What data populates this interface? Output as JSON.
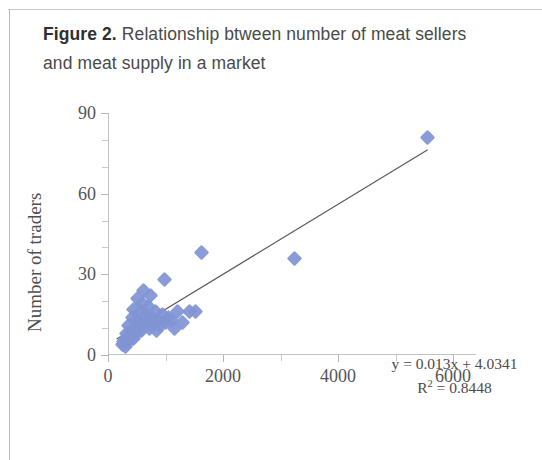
{
  "caption": {
    "figure_label": "Figure 2.",
    "text": " Relationship btween number of meat sellers and meat supply in a market"
  },
  "annotation": {
    "equation": "y = 0.013x + 4.0341",
    "r_squared_prefix": "R",
    "r_squared_exp": "2",
    "r_squared_value": " = 0.8448"
  },
  "colors": {
    "marker": "#8094d4",
    "trendline": "#595959",
    "axis": "#c2c2c2",
    "caption_text": "#4a4a4a"
  },
  "chart_data": {
    "type": "scatter",
    "title": "Figure 2. Relationship btween number of meat sellers and meat supply in a market",
    "xlabel": "Market supply of meat, kg/d",
    "ylabel": "Number of traders",
    "xlim": [
      0,
      6400
    ],
    "ylim": [
      0,
      90
    ],
    "xticks": [
      0,
      2000,
      4000,
      6000
    ],
    "yticks": [
      0,
      30,
      60,
      90
    ],
    "xtick_labels": [
      "0",
      "2000",
      "4000",
      "6000"
    ],
    "ytick_labels": [
      "0",
      "30",
      "60",
      "90"
    ],
    "minor_xticks": [
      1000,
      3000,
      5000
    ],
    "minor_yticks": [
      10,
      20,
      40,
      50,
      70,
      80
    ],
    "grid": false,
    "legend": null,
    "marker_shape": "diamond",
    "series": [
      {
        "name": "Markets",
        "points": [
          [
            250,
            4
          ],
          [
            270,
            5
          ],
          [
            300,
            6
          ],
          [
            310,
            3
          ],
          [
            330,
            8
          ],
          [
            350,
            5
          ],
          [
            360,
            11
          ],
          [
            380,
            7
          ],
          [
            400,
            9
          ],
          [
            420,
            14
          ],
          [
            440,
            6
          ],
          [
            450,
            17
          ],
          [
            470,
            10
          ],
          [
            490,
            13
          ],
          [
            500,
            8
          ],
          [
            520,
            21
          ],
          [
            540,
            12
          ],
          [
            560,
            16
          ],
          [
            580,
            9
          ],
          [
            600,
            19
          ],
          [
            620,
            24
          ],
          [
            640,
            11
          ],
          [
            660,
            15
          ],
          [
            680,
            13
          ],
          [
            700,
            18
          ],
          [
            720,
            10
          ],
          [
            740,
            22
          ],
          [
            760,
            14
          ],
          [
            790,
            12
          ],
          [
            820,
            16
          ],
          [
            850,
            9
          ],
          [
            880,
            13
          ],
          [
            910,
            11
          ],
          [
            950,
            15
          ],
          [
            980,
            28
          ],
          [
            1000,
            12
          ],
          [
            1050,
            14
          ],
          [
            1100,
            13
          ],
          [
            1150,
            10
          ],
          [
            1200,
            16
          ],
          [
            1300,
            12
          ],
          [
            1420,
            16
          ],
          [
            1520,
            16
          ],
          [
            1620,
            38
          ],
          [
            3250,
            36
          ],
          [
            5550,
            81
          ]
        ]
      }
    ],
    "trendline": {
      "equation": "y = 0.013x + 4.0341",
      "slope": 0.013,
      "intercept": 4.0341,
      "r_squared": 0.8448,
      "x_start": 150,
      "x_end": 5560
    }
  }
}
